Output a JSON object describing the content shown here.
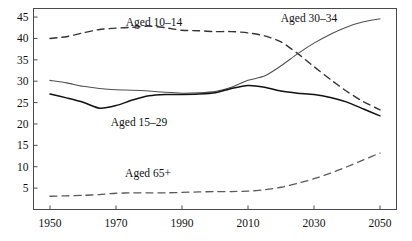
{
  "chart_data": {
    "type": "line",
    "title": "",
    "subtitle": "",
    "xlabel": "",
    "ylabel": "",
    "xlim": [
      1945,
      2055
    ],
    "ylim": [
      0,
      47
    ],
    "grid": false,
    "legend_position": "inline-annotations",
    "xticks": [
      1950,
      1970,
      1990,
      2010,
      2030,
      2050
    ],
    "yticks": [
      5,
      10,
      15,
      20,
      25,
      30,
      35,
      40,
      45
    ],
    "x": [
      1950,
      1955,
      1960,
      1965,
      1970,
      1975,
      1980,
      1985,
      1990,
      1995,
      2000,
      2005,
      2010,
      2015,
      2020,
      2025,
      2030,
      2035,
      2040,
      2045,
      2050
    ],
    "series": [
      {
        "name": "Aged 10-14",
        "style": "dashed",
        "values": [
          40.0,
          40.4,
          41.3,
          42.1,
          42.4,
          42.6,
          42.9,
          42.5,
          41.9,
          41.8,
          41.6,
          41.6,
          41.3,
          40.6,
          39.2,
          36.5,
          33.4,
          30.4,
          27.6,
          25.2,
          23.3
        ]
      },
      {
        "name": "Aged 30-34",
        "style": "solid",
        "values": [
          30.2,
          29.6,
          28.8,
          28.3,
          28.0,
          27.9,
          27.7,
          27.4,
          27.2,
          27.3,
          27.6,
          28.6,
          30.2,
          31.2,
          33.6,
          36.4,
          38.9,
          41.0,
          42.7,
          43.9,
          44.6
        ]
      },
      {
        "name": "Aged 15-29",
        "style": "solid",
        "values": [
          27.0,
          26.1,
          25.1,
          23.7,
          24.3,
          25.6,
          26.6,
          26.9,
          26.9,
          27.0,
          27.3,
          28.3,
          29.0,
          28.6,
          27.7,
          27.2,
          26.9,
          26.2,
          25.1,
          23.5,
          21.9
        ]
      },
      {
        "name": "Aged 65+",
        "style": "dashed",
        "values": [
          3.1,
          3.2,
          3.3,
          3.5,
          3.8,
          3.9,
          3.9,
          3.9,
          4.0,
          4.1,
          4.2,
          4.2,
          4.3,
          4.6,
          5.2,
          6.1,
          7.2,
          8.5,
          10.0,
          11.6,
          13.2
        ]
      }
    ],
    "annotations": [
      {
        "text": "Aged 10-14",
        "x_px": 154,
        "y_px": 26
      },
      {
        "text": "Aged 30-34",
        "x_px": 309,
        "y_px": 22
      },
      {
        "text": "Aged 15-29",
        "x_px": 139,
        "y_px": 126
      },
      {
        "text": "Aged 65+",
        "x_px": 148,
        "y_px": 177
      }
    ]
  }
}
